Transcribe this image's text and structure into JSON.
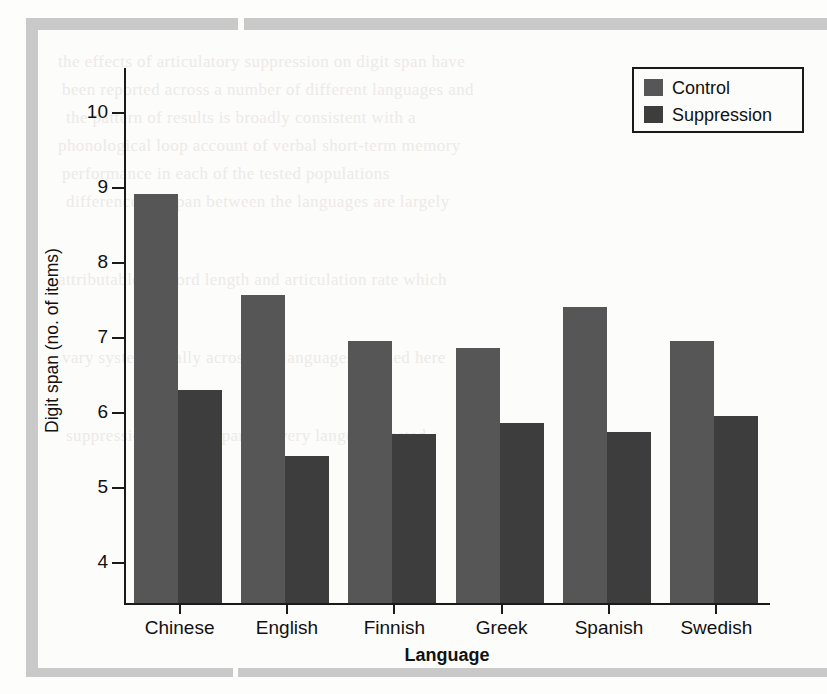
{
  "figure": {
    "background_color": "#fcfcfb",
    "scan_border_color": "#c9c9c9"
  },
  "ghost_text": [
    "the effects of articulatory suppression on digit span have",
    "been reported across a number of different languages and",
    "the pattern of results is broadly consistent with a",
    "phonological loop account of verbal short-term memory",
    "performance in each of the tested populations",
    "differences in span between the languages are largely",
    "attributable to word length and articulation rate which",
    "vary systematically across the languages studied here",
    "suppression reduces span in every language tested"
  ],
  "chart_data": {
    "type": "bar",
    "title": "",
    "xlabel": "Language",
    "ylabel": "Digit span (no. of items)",
    "categories": [
      "Chinese",
      "English",
      "Finnish",
      "Greek",
      "Spanish",
      "Swedish"
    ],
    "series": [
      {
        "name": "Control",
        "color": "#565656",
        "values": [
          8.92,
          7.57,
          6.96,
          6.87,
          7.42,
          6.96
        ]
      },
      {
        "name": "Suppression",
        "color": "#3d3d3d",
        "values": [
          6.31,
          5.43,
          5.72,
          5.87,
          5.75,
          5.96
        ]
      }
    ],
    "ylim": [
      3.47,
      10.6
    ],
    "yticks": [
      4,
      5,
      6,
      7,
      8,
      9,
      10
    ],
    "ytick_labels": [
      "4",
      "5",
      "6",
      "7",
      "8",
      "9",
      "10"
    ],
    "grid": false,
    "legend_position": "top-right",
    "axis_color": "#1a1a1a"
  },
  "legend": {
    "entries": [
      {
        "label": "Control",
        "color": "#565656"
      },
      {
        "label": "Suppression",
        "color": "#3d3d3d"
      }
    ]
  }
}
